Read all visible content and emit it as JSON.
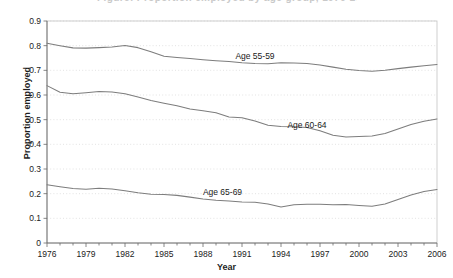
{
  "figure": {
    "title_remnant": "Figure: Proportion employed by age group, 1976-2006",
    "ylabel": "Proportion employed",
    "xlabel": "Year"
  },
  "chart_data": {
    "type": "line",
    "title": "",
    "xlabel": "Year",
    "ylabel": "Proportion employed",
    "xlim": [
      1976,
      2006
    ],
    "ylim": [
      0,
      0.9
    ],
    "grid": true,
    "legend_position": "inline-labels",
    "ytick_labels": [
      "0",
      "0.1",
      "0.2",
      "0.3",
      "0.4",
      "0.5",
      "0.6",
      "0.7",
      "0.8",
      "0.9"
    ],
    "ytick_values": [
      0,
      0.1,
      0.2,
      0.3,
      0.4,
      0.5,
      0.6,
      0.7,
      0.8,
      0.9
    ],
    "xtick_labels": [
      "1976",
      "1979",
      "1982",
      "1985",
      "1988",
      "1991",
      "1994",
      "1997",
      "2000",
      "2003",
      "2006"
    ],
    "xtick_values": [
      1976,
      1979,
      1982,
      1985,
      1988,
      1991,
      1994,
      1997,
      2000,
      2003,
      2006
    ],
    "x": [
      1976,
      1977,
      1978,
      1979,
      1980,
      1981,
      1982,
      1983,
      1984,
      1985,
      1986,
      1987,
      1988,
      1989,
      1990,
      1991,
      1992,
      1993,
      1994,
      1995,
      1996,
      1997,
      1998,
      1999,
      2000,
      2001,
      2002,
      2003,
      2004,
      2005,
      2006
    ],
    "series": [
      {
        "name": "Age 55-59",
        "label": "Age 55-59",
        "label_x": 1992.0,
        "label_y": 0.745,
        "color": "#7d7d7d",
        "values": [
          0.81,
          0.8,
          0.791,
          0.79,
          0.792,
          0.795,
          0.801,
          0.792,
          0.775,
          0.757,
          0.752,
          0.748,
          0.743,
          0.739,
          0.736,
          0.731,
          0.728,
          0.727,
          0.731,
          0.73,
          0.728,
          0.722,
          0.713,
          0.704,
          0.699,
          0.696,
          0.7,
          0.707,
          0.713,
          0.719,
          0.724
        ]
      },
      {
        "name": "Age 60-64",
        "label": "Age 60-64",
        "label_x": 1996.0,
        "label_y": 0.468,
        "color": "#7d7d7d",
        "values": [
          0.638,
          0.611,
          0.605,
          0.609,
          0.614,
          0.612,
          0.605,
          0.592,
          0.578,
          0.567,
          0.556,
          0.543,
          0.536,
          0.528,
          0.511,
          0.508,
          0.495,
          0.477,
          0.472,
          0.471,
          0.468,
          0.455,
          0.437,
          0.43,
          0.432,
          0.434,
          0.444,
          0.462,
          0.48,
          0.494,
          0.503
        ]
      },
      {
        "name": "Age 65-69",
        "label": "Age 65-69",
        "label_x": 1989.5,
        "label_y": 0.196,
        "color": "#7d7d7d",
        "values": [
          0.236,
          0.228,
          0.221,
          0.218,
          0.222,
          0.219,
          0.212,
          0.204,
          0.198,
          0.197,
          0.193,
          0.186,
          0.178,
          0.173,
          0.17,
          0.166,
          0.165,
          0.158,
          0.146,
          0.155,
          0.157,
          0.157,
          0.155,
          0.156,
          0.152,
          0.149,
          0.158,
          0.176,
          0.195,
          0.209,
          0.217
        ]
      }
    ]
  }
}
